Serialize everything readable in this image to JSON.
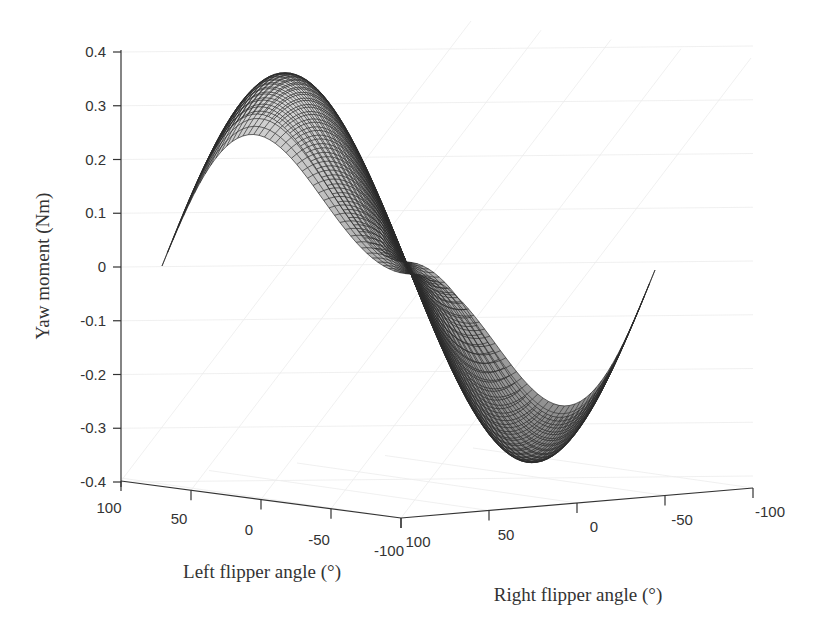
{
  "chart_data": {
    "type": "surface3d",
    "title": "",
    "zlabel": "Yaw moment (Nm)",
    "xlabel": "Left flipper angle (°)",
    "ylabel": "Right flipper angle (°)",
    "zlim": [
      -0.4,
      0.4
    ],
    "xlim": [
      -100,
      100
    ],
    "ylim": [
      -100,
      100
    ],
    "z_ticks": [
      "0.4",
      "0.3",
      "0.2",
      "0.1",
      "0",
      "-0.1",
      "-0.2",
      "-0.3",
      "-0.4"
    ],
    "x_ticks": [
      "100",
      "50",
      "0",
      "-50",
      "-100"
    ],
    "y_ticks": [
      "100",
      "50",
      "0",
      "-50",
      "-100"
    ],
    "grid": true,
    "colormap": "gray",
    "mesh_edges": "dark",
    "surface_description": "Saddle-like surface: yaw moment is zero along left=right diagonal, positive peaks ~0.36 Nm and ~0.25 Nm, negative troughs ~-0.39 Nm and ~-0.27 Nm",
    "extrema": {
      "max_peak_z": 0.36,
      "secondary_peak_z": 0.25,
      "min_trough_z": -0.39,
      "secondary_trough_z": -0.27
    }
  },
  "axes": {
    "z_title": "Yaw moment (Nm)",
    "x_title": "Left flipper angle (°)",
    "y_title": "Right flipper angle (°)",
    "z_ticks": [
      "0.4",
      "0.3",
      "0.2",
      "0.1",
      "0",
      "-0.1",
      "-0.2",
      "-0.3",
      "-0.4"
    ],
    "x_ticks": [
      "100",
      "50",
      "0",
      "-50",
      "-100"
    ],
    "y_ticks": [
      "100",
      "50",
      "0",
      "-50",
      "-100"
    ]
  }
}
